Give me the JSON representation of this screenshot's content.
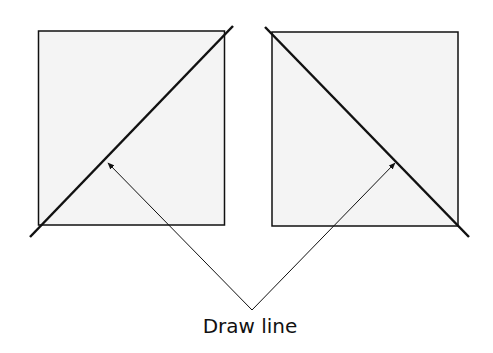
{
  "diagram": {
    "label": "Draw line",
    "colors": {
      "fill": "#f4f4f4",
      "stroke": "#111111",
      "background": "#ffffff"
    },
    "left_square": {
      "x": 38.5,
      "y": 31,
      "size": 186,
      "diagonal": [
        30,
        237,
        233,
        26
      ]
    },
    "right_square": {
      "x": 272,
      "y": 32,
      "size": 186,
      "diagonal": [
        265,
        27,
        469,
        237
      ]
    },
    "arrow_origin": [
      252,
      310
    ],
    "arrow_targets": [
      [
        108,
        163
      ],
      [
        395,
        163
      ]
    ]
  }
}
